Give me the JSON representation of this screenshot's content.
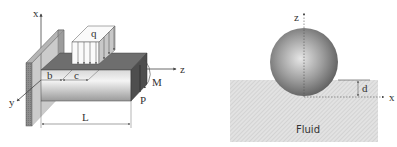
{
  "beam_figure": {
    "axis_labels": {
      "x": "x",
      "y": "y",
      "z": "z"
    },
    "load_label": "q",
    "dimension_labels": {
      "b": "b",
      "c": "c",
      "L": "L"
    },
    "moment_label": "M",
    "force_label": "P"
  },
  "sphere_figure": {
    "axis_labels": {
      "z": "z",
      "x": "x"
    },
    "depth_label": "d",
    "fluid_label": "Fluid"
  },
  "colors": {
    "wall": "#8a8a8a",
    "beam_top": "#6e6e6e",
    "beam_end": "#555555",
    "fluid": "#d9d9d9",
    "sphere": "#8c8c8c",
    "line": "#444444"
  }
}
